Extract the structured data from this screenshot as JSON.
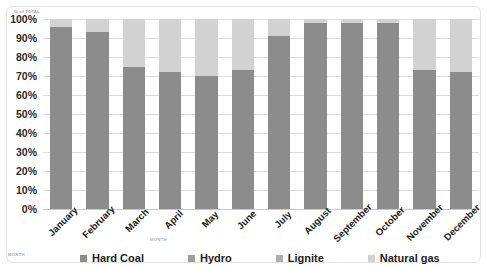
{
  "chart_data": {
    "type": "bar",
    "subtype": "100% stacked column",
    "title": "",
    "xlabel": "MONTH",
    "ylabel": "% of TOTAL",
    "ylim": [
      0,
      100
    ],
    "grid": true,
    "legend_position": "bottom",
    "categories": [
      "January",
      "February",
      "March",
      "April",
      "May",
      "June",
      "July",
      "August",
      "September",
      "October",
      "November",
      "December"
    ],
    "ytick_labels": [
      "100%",
      "90%",
      "80%",
      "70%",
      "60%",
      "50%",
      "40%",
      "30%",
      "20%",
      "10%",
      "0%"
    ],
    "ytick_values": [
      100,
      90,
      80,
      70,
      60,
      50,
      40,
      30,
      20,
      10,
      0
    ],
    "series": [
      {
        "name": "Hard Coal",
        "color": "#8c8c8c",
        "values": [
          96,
          93,
          75,
          72,
          70,
          73,
          91,
          98,
          98,
          98,
          73,
          72
        ]
      },
      {
        "name": "Hydro",
        "color": "#9e9e9e",
        "values": [
          0,
          0,
          0,
          0,
          0,
          0,
          0,
          0,
          0,
          0,
          0,
          0
        ]
      },
      {
        "name": "Lignite",
        "color": "#adadad",
        "values": [
          0,
          0,
          0,
          0,
          0,
          0,
          0,
          0,
          0,
          0,
          0,
          0
        ]
      },
      {
        "name": "Natural gas",
        "color": "#d2d2d2",
        "values": [
          4,
          7,
          25,
          28,
          30,
          27,
          9,
          2,
          2,
          2,
          27,
          28
        ]
      }
    ]
  },
  "legend": {
    "items": [
      {
        "label": "Hard Coal",
        "color": "#8c8c8c"
      },
      {
        "label": "Hydro",
        "color": "#9e9e9e"
      },
      {
        "label": "Lignite",
        "color": "#adadad"
      },
      {
        "label": "Natural gas",
        "color": "#d2d2d2"
      }
    ]
  },
  "axes": {
    "y_title": "% of TOTAL",
    "x_title": "MONTH",
    "corner_title": "MONTH"
  }
}
